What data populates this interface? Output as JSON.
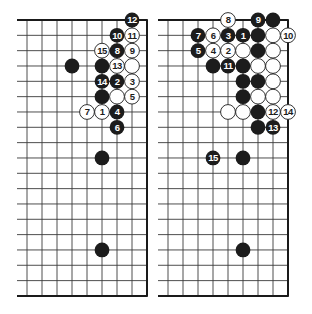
{
  "colors": {
    "background": "#ffffff",
    "grid_line": "#3a3a3a",
    "edge_line": "#1a1a1a",
    "black_stone": "#1c1c1c",
    "white_stone": "#ffffff",
    "label_on_black": "#ffffff",
    "label_on_white": "#1c1c1c"
  },
  "layout": {
    "row_top": 20,
    "row_spacing": 15.33,
    "rows": 19,
    "col_spacing": 15,
    "stone_radius": 7.4
  },
  "diagrams": [
    {
      "id": "left",
      "title": "Diagram 1",
      "line_start_x": 17,
      "first_col_x": 27,
      "cols": 9,
      "stones": [
        {
          "col": 7,
          "row": 0,
          "color": "black",
          "label": "12"
        },
        {
          "col": 6,
          "row": 1,
          "color": "black",
          "label": "10"
        },
        {
          "col": 7,
          "row": 1,
          "color": "white",
          "label": "11"
        },
        {
          "col": 5,
          "row": 2,
          "color": "white",
          "label": "15"
        },
        {
          "col": 6,
          "row": 2,
          "color": "black",
          "label": "8"
        },
        {
          "col": 7,
          "row": 2,
          "color": "white",
          "label": "9"
        },
        {
          "col": 3,
          "row": 3,
          "color": "black",
          "label": ""
        },
        {
          "col": 5,
          "row": 3,
          "color": "black",
          "label": ""
        },
        {
          "col": 6,
          "row": 3,
          "color": "white",
          "label": "13"
        },
        {
          "col": 7,
          "row": 3,
          "color": "white",
          "label": ""
        },
        {
          "col": 5,
          "row": 4,
          "color": "black",
          "label": "14"
        },
        {
          "col": 6,
          "row": 4,
          "color": "black",
          "label": "2"
        },
        {
          "col": 7,
          "row": 4,
          "color": "white",
          "label": "3"
        },
        {
          "col": 5,
          "row": 5,
          "color": "black",
          "label": ""
        },
        {
          "col": 6,
          "row": 5,
          "color": "white",
          "label": ""
        },
        {
          "col": 7,
          "row": 5,
          "color": "white",
          "label": "5"
        },
        {
          "col": 4,
          "row": 6,
          "color": "white",
          "label": "7"
        },
        {
          "col": 5,
          "row": 6,
          "color": "white",
          "label": "1"
        },
        {
          "col": 6,
          "row": 6,
          "color": "black",
          "label": "4"
        },
        {
          "col": 6,
          "row": 7,
          "color": "black",
          "label": "6"
        },
        {
          "col": 5,
          "row": 9,
          "color": "black",
          "label": ""
        },
        {
          "col": 5,
          "row": 15,
          "color": "black",
          "label": ""
        }
      ]
    },
    {
      "id": "right",
      "title": "Diagram 2",
      "line_start_x": 158,
      "first_col_x": 168,
      "cols": 9,
      "stones": [
        {
          "col": 4,
          "row": 0,
          "color": "white",
          "label": "8"
        },
        {
          "col": 6,
          "row": 0,
          "color": "black",
          "label": "9"
        },
        {
          "col": 7,
          "row": 0,
          "color": "black",
          "label": ""
        },
        {
          "col": 2,
          "row": 1,
          "color": "black",
          "label": "7"
        },
        {
          "col": 3,
          "row": 1,
          "color": "white",
          "label": "6"
        },
        {
          "col": 4,
          "row": 1,
          "color": "black",
          "label": "3"
        },
        {
          "col": 5,
          "row": 1,
          "color": "black",
          "label": "1"
        },
        {
          "col": 6,
          "row": 1,
          "color": "black",
          "label": ""
        },
        {
          "col": 7,
          "row": 1,
          "color": "white",
          "label": ""
        },
        {
          "col": 8,
          "row": 1,
          "color": "white",
          "label": "10"
        },
        {
          "col": 2,
          "row": 2,
          "color": "black",
          "label": "5"
        },
        {
          "col": 3,
          "row": 2,
          "color": "white",
          "label": "4"
        },
        {
          "col": 4,
          "row": 2,
          "color": "white",
          "label": "2"
        },
        {
          "col": 5,
          "row": 2,
          "color": "white",
          "label": ""
        },
        {
          "col": 6,
          "row": 2,
          "color": "black",
          "label": ""
        },
        {
          "col": 7,
          "row": 2,
          "color": "white",
          "label": ""
        },
        {
          "col": 3,
          "row": 3,
          "color": "black",
          "label": ""
        },
        {
          "col": 4,
          "row": 3,
          "color": "black",
          "label": "11"
        },
        {
          "col": 5,
          "row": 3,
          "color": "black",
          "label": ""
        },
        {
          "col": 6,
          "row": 3,
          "color": "white",
          "label": ""
        },
        {
          "col": 7,
          "row": 3,
          "color": "white",
          "label": ""
        },
        {
          "col": 5,
          "row": 4,
          "color": "black",
          "label": ""
        },
        {
          "col": 6,
          "row": 4,
          "color": "black",
          "label": ""
        },
        {
          "col": 7,
          "row": 4,
          "color": "white",
          "label": ""
        },
        {
          "col": 5,
          "row": 5,
          "color": "black",
          "label": ""
        },
        {
          "col": 6,
          "row": 5,
          "color": "white",
          "label": ""
        },
        {
          "col": 7,
          "row": 5,
          "color": "white",
          "label": ""
        },
        {
          "col": 4,
          "row": 6,
          "color": "white",
          "label": ""
        },
        {
          "col": 5,
          "row": 6,
          "color": "white",
          "label": ""
        },
        {
          "col": 6,
          "row": 6,
          "color": "black",
          "label": ""
        },
        {
          "col": 7,
          "row": 6,
          "color": "white",
          "label": "12"
        },
        {
          "col": 8,
          "row": 6,
          "color": "white",
          "label": "14"
        },
        {
          "col": 6,
          "row": 7,
          "color": "black",
          "label": ""
        },
        {
          "col": 7,
          "row": 7,
          "color": "black",
          "label": "13"
        },
        {
          "col": 3,
          "row": 9,
          "color": "black",
          "label": "15"
        },
        {
          "col": 5,
          "row": 9,
          "color": "black",
          "label": ""
        },
        {
          "col": 5,
          "row": 15,
          "color": "black",
          "label": ""
        }
      ]
    }
  ]
}
